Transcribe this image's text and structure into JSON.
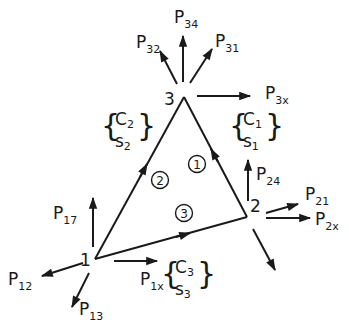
{
  "diagram": {
    "type": "triangular-element-force-diagram",
    "colors": {
      "ink": "#1a1a1a",
      "background": "#ffffff"
    },
    "nodes": [
      {
        "id": "1",
        "label": "1",
        "x": 95,
        "y": 259
      },
      {
        "id": "2",
        "label": "2",
        "x": 247,
        "y": 217
      },
      {
        "id": "3",
        "label": "3",
        "x": 184,
        "y": 97
      }
    ],
    "sides": [
      {
        "id": "1",
        "circle_label": "1",
        "from": "2",
        "to": "3",
        "params": {
          "c": "C",
          "c_sub": "1",
          "s": "s",
          "s_sub": "1"
        }
      },
      {
        "id": "2",
        "circle_label": "2",
        "from": "1",
        "to": "3",
        "params": {
          "c": "C",
          "c_sub": "2",
          "s": "s",
          "s_sub": "2"
        }
      },
      {
        "id": "3",
        "circle_label": "3",
        "from": "1",
        "to": "2",
        "params": {
          "c": "C",
          "c_sub": "3",
          "s": "s",
          "s_sub": "3"
        }
      }
    ],
    "forces": {
      "P32": {
        "main": "P",
        "sub": "32"
      },
      "P34": {
        "main": "P",
        "sub": "34"
      },
      "P31": {
        "main": "P",
        "sub": "31"
      },
      "P3x": {
        "main": "P",
        "sub": "3x"
      },
      "P24": {
        "main": "P",
        "sub": "24"
      },
      "P21": {
        "main": "P",
        "sub": "21"
      },
      "P2x": {
        "main": "P",
        "sub": "2x"
      },
      "P17": {
        "main": "P",
        "sub": "17"
      },
      "P12": {
        "main": "P",
        "sub": "12"
      },
      "P13": {
        "main": "P",
        "sub": "13"
      },
      "P1x": {
        "main": "P",
        "sub": "1x"
      }
    }
  }
}
